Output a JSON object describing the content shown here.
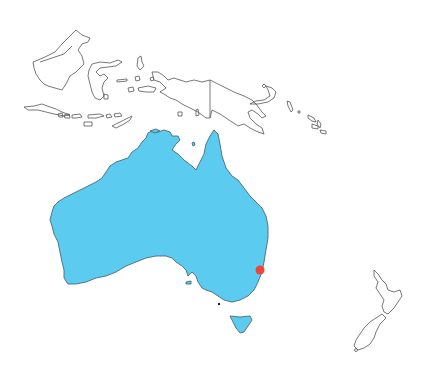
{
  "map": {
    "region": "Oceania",
    "highlighted_country": "Australia",
    "highlight_color": "#5BCBF0",
    "outline_color": "#555555",
    "background": "#ffffff",
    "marker": {
      "color": "#F0453A",
      "x": 260,
      "y": 270,
      "radius": 4.5
    },
    "regions_outlined": [
      "Indonesia",
      "Malaysia (Borneo)",
      "Papua New Guinea",
      "Solomon Islands",
      "New Zealand",
      "Timor"
    ]
  }
}
